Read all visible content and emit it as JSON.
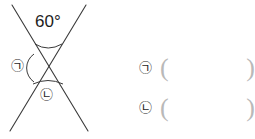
{
  "figure": {
    "type": "vertical-angles-diagram",
    "known_angle": {
      "value": "60",
      "unit_symbol": "°",
      "label": "60°",
      "position": "top"
    },
    "marked_angles": [
      {
        "symbol": "㉠",
        "position": "left",
        "arc": true
      },
      {
        "symbol": "㉡",
        "position": "bottom",
        "arc": true
      }
    ],
    "lines": [
      {
        "name": "line-1",
        "from": [
          12,
          5
        ],
        "to": [
          88,
          131
        ]
      },
      {
        "name": "line-2",
        "from": [
          86,
          5
        ],
        "to": [
          10,
          131
        ]
      }
    ],
    "intersection": [
      48,
      68
    ]
  },
  "answers": {
    "rows": [
      {
        "symbol": "㉠",
        "open": "(",
        "value": "",
        "close": ")"
      },
      {
        "symbol": "㉡",
        "open": "(",
        "value": "",
        "close": ")"
      }
    ]
  },
  "colors": {
    "ink": "#1a1a1a",
    "line": "#3a3a3a",
    "paren": "#b9b9b9",
    "background": "#ffffff"
  }
}
